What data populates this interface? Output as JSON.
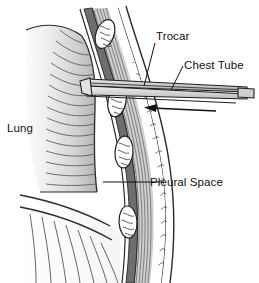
{
  "figure": {
    "type": "medical-illustration",
    "background_color": "#ffffff",
    "line_color": "#1a1a1a",
    "view": "cross-sectional cutaway of thorax, lung at left, chest wall curving at right"
  },
  "labels": {
    "trocar": "Trocar",
    "chest_tube": "Chest Tube",
    "lung": "Lung",
    "pleural_space": "Pleural Space"
  },
  "annotations": {
    "insertion_arrow": "arrow pointing left indicating direction of tube insertion"
  },
  "anatomy": {
    "lung_fill_light": "#f2f2f2",
    "lung_fill_dark": "#b4b4b4",
    "rib_fill": "#ffffff",
    "pleura_fill": "#6e6e6e",
    "muscle_fill": "#d8d8d8",
    "fat_fill": "#ffffff",
    "parts": [
      "lung",
      "diaphragm",
      "pleural space",
      "rib",
      "intercostal muscle",
      "subcutaneous fat",
      "skin"
    ]
  },
  "instrument": {
    "tube_fill": "#d0d0d0",
    "trocar_fill": "#bdbdbd",
    "description": "tapered chest tube with trocar inserted between ribs"
  }
}
